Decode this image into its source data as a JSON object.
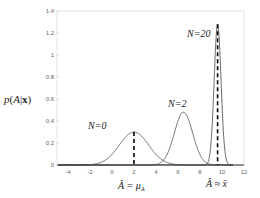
{
  "chart_data": {
    "type": "line",
    "title": "",
    "xlabel": "",
    "ylabel": "p(A|x)",
    "xlim": [
      -5,
      12
    ],
    "ylim": [
      0,
      1.4
    ],
    "grid": false,
    "x_ticks": [
      "-4",
      "-2",
      "0",
      "2",
      "4",
      "6",
      "8",
      "10",
      "12"
    ],
    "y_ticks": [
      "0",
      "0.2",
      "0.4",
      "0.6",
      "0.8",
      "1",
      "1.2",
      "1.4"
    ],
    "series": [
      {
        "name": "N=0",
        "type": "gaussian",
        "mean": 2.0,
        "peak": 0.3,
        "sigma": 1.33
      },
      {
        "name": "N=2",
        "type": "gaussian",
        "mean": 6.5,
        "peak": 0.48,
        "sigma": 0.83
      },
      {
        "name": "N=20",
        "type": "gaussian",
        "mean": 9.6,
        "peak": 1.28,
        "sigma": 0.31
      }
    ],
    "markers": [
      {
        "x": 2.0,
        "style": "dashed",
        "label": "Â = μ_A"
      },
      {
        "x": 9.6,
        "style": "dashed",
        "label": "Â ≈ x̄"
      }
    ],
    "annotations": [
      "N=0",
      "N=2",
      "N=20",
      "Â = μ_A",
      "Â ≈ x̄"
    ]
  },
  "labels": {
    "ylabel": "p(A|x)",
    "n0": "N=0",
    "n2": "N=2",
    "n20": "N=20",
    "marker1": "Â = μ",
    "marker1_sub": "A",
    "marker2": "Â ≈ x̄"
  }
}
